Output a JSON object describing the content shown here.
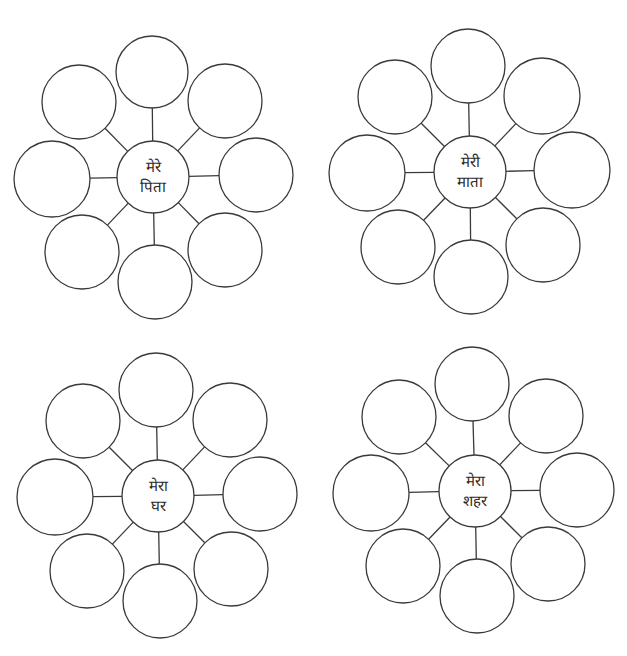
{
  "diagrams": [
    {
      "name": "mere-pita",
      "center": {
        "x": 153,
        "y": 177,
        "r": 36,
        "label_lines": [
          "मेरे",
          "पिता"
        ]
      },
      "outer": [
        {
          "x": 152,
          "y": 72,
          "r": 36
        },
        {
          "x": 225,
          "y": 101,
          "r": 37
        },
        {
          "x": 256,
          "y": 175,
          "r": 37
        },
        {
          "x": 225,
          "y": 250,
          "r": 37
        },
        {
          "x": 155,
          "y": 282,
          "r": 37
        },
        {
          "x": 82,
          "y": 252,
          "r": 37
        },
        {
          "x": 52,
          "y": 179,
          "r": 38
        },
        {
          "x": 79,
          "y": 102,
          "r": 37
        }
      ]
    },
    {
      "name": "meri-mata",
      "center": {
        "x": 470,
        "y": 172,
        "r": 36,
        "label_lines": [
          "मेरी",
          "माता"
        ]
      },
      "outer": [
        {
          "x": 468,
          "y": 66,
          "r": 37
        },
        {
          "x": 542,
          "y": 96,
          "r": 38
        },
        {
          "x": 572,
          "y": 170,
          "r": 38
        },
        {
          "x": 543,
          "y": 245,
          "r": 37
        },
        {
          "x": 471,
          "y": 277,
          "r": 37
        },
        {
          "x": 398,
          "y": 247,
          "r": 37
        },
        {
          "x": 367,
          "y": 173,
          "r": 38
        },
        {
          "x": 395,
          "y": 97,
          "r": 37
        }
      ]
    },
    {
      "name": "mera-ghar",
      "center": {
        "x": 158,
        "y": 496,
        "r": 36,
        "label_lines": [
          "मेरा",
          "घर"
        ]
      },
      "outer": [
        {
          "x": 156,
          "y": 390,
          "r": 37
        },
        {
          "x": 230,
          "y": 420,
          "r": 37
        },
        {
          "x": 260,
          "y": 494,
          "r": 37
        },
        {
          "x": 231,
          "y": 569,
          "r": 37
        },
        {
          "x": 160,
          "y": 601,
          "r": 37
        },
        {
          "x": 87,
          "y": 571,
          "r": 37
        },
        {
          "x": 55,
          "y": 497,
          "r": 38
        },
        {
          "x": 83,
          "y": 421,
          "r": 37
        }
      ]
    },
    {
      "name": "mera-shahar",
      "center": {
        "x": 475,
        "y": 491,
        "r": 36,
        "label_lines": [
          "मेरा",
          "शहर"
        ]
      },
      "outer": [
        {
          "x": 472,
          "y": 384,
          "r": 37
        },
        {
          "x": 546,
          "y": 416,
          "r": 37
        },
        {
          "x": 577,
          "y": 490,
          "r": 37
        },
        {
          "x": 548,
          "y": 564,
          "r": 37
        },
        {
          "x": 477,
          "y": 596,
          "r": 37
        },
        {
          "x": 403,
          "y": 566,
          "r": 37
        },
        {
          "x": 371,
          "y": 493,
          "r": 38
        },
        {
          "x": 399,
          "y": 417,
          "r": 37
        }
      ]
    }
  ],
  "style": {
    "stroke_color": "#3a3a3a",
    "background": "#ffffff",
    "text_color": "#2a2a2a"
  }
}
